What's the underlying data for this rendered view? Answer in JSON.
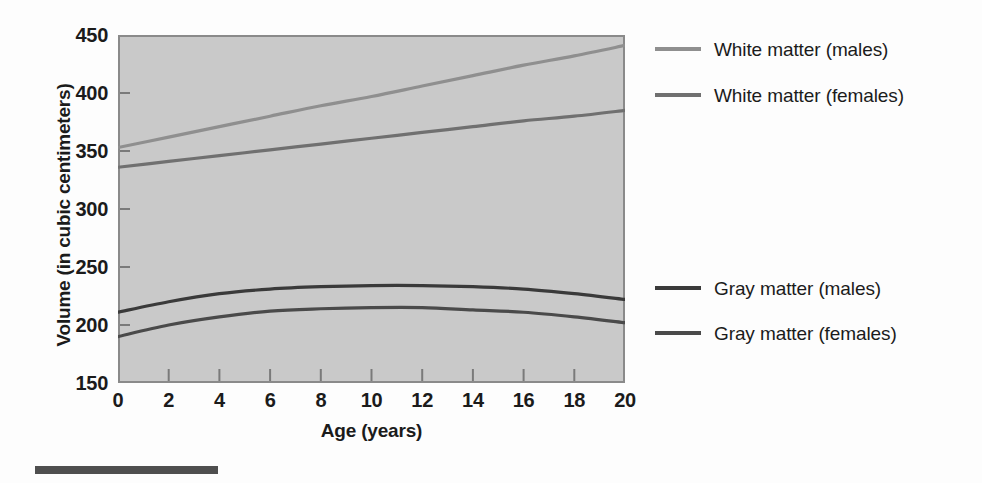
{
  "chart_data": {
    "type": "line",
    "title": "",
    "xlabel": "Age (years)",
    "ylabel": "Volume (in cubic centimeters)",
    "xlim": [
      0,
      20
    ],
    "ylim": [
      150,
      450
    ],
    "xticks": [
      0,
      2,
      4,
      6,
      8,
      10,
      12,
      14,
      16,
      18,
      20
    ],
    "yticks": [
      150,
      200,
      250,
      300,
      350,
      400,
      450
    ],
    "grid": false,
    "legend_position": "right",
    "plot_background": "#c9c9c9",
    "x": [
      0,
      2,
      4,
      6,
      8,
      10,
      12,
      14,
      16,
      18,
      20
    ],
    "series": [
      {
        "name": "White matter (males)",
        "color": "#8f8f8f",
        "values": [
          353,
          362,
          371,
          380,
          389,
          397,
          406,
          415,
          424,
          432,
          441
        ]
      },
      {
        "name": "White matter (females)",
        "color": "#707070",
        "values": [
          336,
          341,
          346,
          351,
          356,
          361,
          366,
          371,
          376,
          380,
          385
        ]
      },
      {
        "name": "Gray matter (males)",
        "color": "#3a3a3a",
        "values": [
          211,
          220,
          227,
          231,
          233,
          234,
          234,
          233,
          231,
          227,
          222
        ]
      },
      {
        "name": "Gray matter (females)",
        "color": "#4a4a4a",
        "values": [
          190,
          200,
          207,
          212,
          214,
          215,
          215,
          213,
          211,
          207,
          202
        ]
      }
    ]
  },
  "axes": {
    "y_title": "Volume (in cubic centimeters)",
    "x_title": "Age (years)",
    "y_tick_labels": [
      "450",
      "400",
      "350",
      "300",
      "250",
      "200",
      "150"
    ],
    "x_tick_labels": [
      "0",
      "2",
      "4",
      "6",
      "8",
      "10",
      "12",
      "14",
      "16",
      "18",
      "20"
    ]
  },
  "legend": {
    "entries": [
      {
        "label": "White matter (males)",
        "color": "#8f8f8f"
      },
      {
        "label": "White matter (females)",
        "color": "#707070"
      },
      {
        "label": "Gray matter (males)",
        "color": "#3a3a3a"
      },
      {
        "label": "Gray matter (females)",
        "color": "#4a4a4a"
      }
    ]
  }
}
